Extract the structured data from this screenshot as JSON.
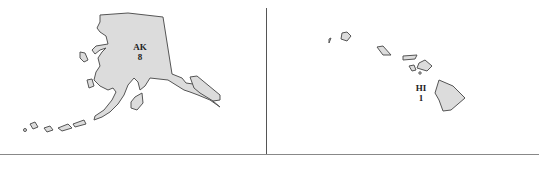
{
  "map": {
    "insets": [
      {
        "state": "AK",
        "value": "8"
      },
      {
        "state": "HI",
        "value": "1"
      }
    ],
    "colors": {
      "fill": "#dcdcdc",
      "stroke": "#555555",
      "background": "#ffffff"
    }
  }
}
